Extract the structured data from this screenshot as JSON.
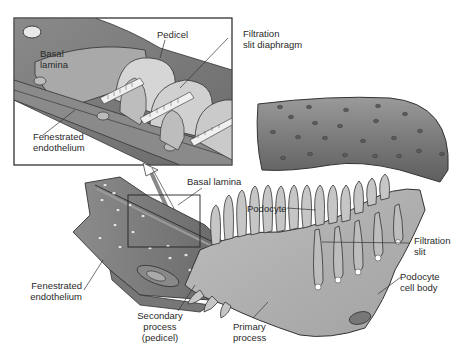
{
  "diagram": {
    "colors": {
      "capillary_dark": "#6e6e6e",
      "capillary_mid": "#8a8a8a",
      "podocyte_light": "#c8c8c8",
      "podocyte_mid": "#b0b0b0",
      "outline": "#2b2b2b",
      "background": "#ffffff"
    },
    "inset": {
      "labels": {
        "pedicel": "Pedicel",
        "basal_lamina": "Basal\nlamina",
        "filtration_slit_diaphragm": "Filtration\nslit diaphragm",
        "fenestrated_endothelium": "Fenestrated\nendothelium"
      }
    },
    "main": {
      "labels": {
        "basal_lamina": "Basal lamina",
        "podocyte": "Podocyte",
        "filtration_slit": "Filtration\nslit",
        "podocyte_cell_body": "Podocyte\ncell body",
        "fenestrated_endothelium": "Fenestrated\nendothelium",
        "secondary_process": "Secondary\nprocess\n(pedicel)",
        "primary_process": "Primary\nprocess"
      }
    }
  }
}
